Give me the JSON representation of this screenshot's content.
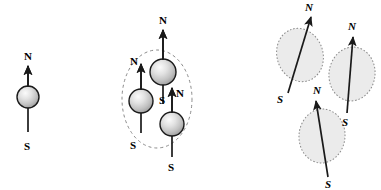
{
  "figure": {
    "width": 381,
    "height": 190,
    "background_color": "#ffffff",
    "stroke_color": "#1a1a1a",
    "dash_color": "#8a8a8a",
    "domain_fill_color": "#ebebeb",
    "sphere_light_color": "#f2f2f2",
    "sphere_mid_color": "#c8c8c8",
    "sphere_dark_color": "#9a9a9a",
    "sphere_edge_color": "#1a1a1a"
  },
  "groups": [
    {
      "id": "single-dipole",
      "name": "single-magnet",
      "label": "Single magnetic dipole",
      "enclosure": null,
      "magnets": [
        {
          "id": "m1",
          "sphere": {
            "cx": 28,
            "cy": 97,
            "r": 11
          },
          "arrow": {
            "x1": 28,
            "y1": 132,
            "x2": 28,
            "y2": 66
          },
          "north_label": {
            "text": "N",
            "x": 24,
            "y": 51,
            "italic": false
          },
          "south_label": {
            "text": "S",
            "x": 24,
            "y": 141,
            "italic": false
          }
        }
      ]
    },
    {
      "id": "aligned-cluster",
      "name": "aligned-domain-cluster",
      "label": "Three aligned dipoles in one domain",
      "enclosure": {
        "cx": 157,
        "cy": 99,
        "rx": 35,
        "ry": 49,
        "rotate": 0
      },
      "magnets": [
        {
          "id": "m2",
          "sphere": {
            "cx": 163,
            "cy": 72,
            "r": 13
          },
          "arrow": {
            "x1": 163,
            "y1": 104,
            "x2": 163,
            "y2": 30
          },
          "north_label": {
            "text": "N",
            "x": 159,
            "y": 15,
            "italic": false
          },
          "south_label": {
            "text": "S",
            "x": 159,
            "y": 95,
            "italic": false
          }
        },
        {
          "id": "m3",
          "sphere": {
            "cx": 141,
            "cy": 101,
            "r": 12
          },
          "arrow": {
            "x1": 141,
            "y1": 133,
            "x2": 141,
            "y2": 64
          },
          "north_label": {
            "text": "N",
            "x": 130,
            "y": 56,
            "italic": false
          },
          "south_label": {
            "text": "S",
            "x": 130,
            "y": 140,
            "italic": false
          }
        },
        {
          "id": "m4",
          "sphere": {
            "cx": 172,
            "cy": 124,
            "r": 12
          },
          "arrow": {
            "x1": 172,
            "y1": 157,
            "x2": 172,
            "y2": 88
          },
          "north_label": {
            "text": "N",
            "x": 176,
            "y": 88,
            "italic": false
          },
          "south_label": {
            "text": "S",
            "x": 168,
            "y": 162,
            "italic": false
          }
        }
      ]
    },
    {
      "id": "random-domains",
      "name": "randomly-oriented-domains",
      "label": "Three randomly oriented domains",
      "enclosure": null,
      "magnets": [
        {
          "id": "m5",
          "domain": {
            "cx": 300,
            "cy": 55,
            "rx": 23,
            "ry": 27,
            "rotate": -18
          },
          "arrow": {
            "x1": 288,
            "y1": 93,
            "x2": 311,
            "y2": 17
          },
          "north_label": {
            "text": "N",
            "x": 305,
            "y": 2,
            "italic": true
          },
          "south_label": {
            "text": "S",
            "x": 277,
            "y": 94,
            "italic": true
          }
        },
        {
          "id": "m6",
          "domain": {
            "cx": 352,
            "cy": 74,
            "rx": 23,
            "ry": 27,
            "rotate": 8
          },
          "arrow": {
            "x1": 347,
            "y1": 113,
            "x2": 353,
            "y2": 37
          },
          "north_label": {
            "text": "N",
            "x": 348,
            "y": 21,
            "italic": true
          },
          "south_label": {
            "text": "S",
            "x": 342,
            "y": 117,
            "italic": true
          }
        },
        {
          "id": "m7",
          "domain": {
            "cx": 322,
            "cy": 136,
            "rx": 23,
            "ry": 27,
            "rotate": 5
          },
          "arrow": {
            "x1": 328,
            "y1": 177,
            "x2": 316,
            "y2": 101
          },
          "north_label": {
            "text": "N",
            "x": 313,
            "y": 85,
            "italic": true
          },
          "south_label": {
            "text": "S",
            "x": 325,
            "y": 179,
            "italic": true
          }
        }
      ]
    }
  ]
}
